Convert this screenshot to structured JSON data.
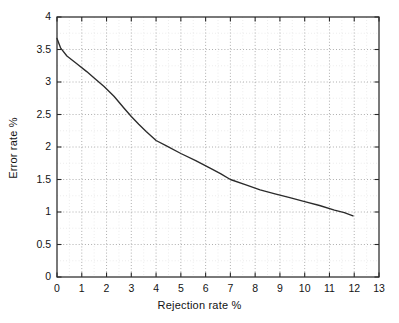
{
  "chart_data": {
    "type": "line",
    "title": "",
    "xlabel": "Rejection rate %",
    "ylabel": "Error rate %",
    "xlim": [
      0,
      13
    ],
    "ylim": [
      0,
      4
    ],
    "xticks": [
      "0",
      "1",
      "2",
      "3",
      "4",
      "5",
      "6",
      "7",
      "8",
      "9",
      "10",
      "11",
      "12",
      "13"
    ],
    "yticks": [
      "0",
      "0.5",
      "1",
      "1.5",
      "2",
      "2.5",
      "3",
      "3.5",
      "4"
    ],
    "grid": true,
    "grid_style": "dotted",
    "minor_grid": true,
    "legend": "none",
    "series": [
      {
        "name": "error vs rejection",
        "color": "#2b2b2b",
        "x": [
          0.0,
          0.15,
          0.4,
          0.8,
          1.2,
          1.5,
          1.9,
          2.3,
          2.7,
          3.0,
          3.3,
          3.6,
          4.0,
          4.4,
          5.0,
          5.6,
          6.2,
          6.6,
          7.0,
          7.6,
          8.2,
          8.8,
          9.4,
          10.0,
          10.6,
          11.2,
          11.6,
          11.95
        ],
        "y": [
          3.67,
          3.52,
          3.4,
          3.28,
          3.16,
          3.06,
          2.93,
          2.78,
          2.6,
          2.47,
          2.35,
          2.24,
          2.1,
          2.02,
          1.9,
          1.79,
          1.67,
          1.59,
          1.5,
          1.42,
          1.34,
          1.28,
          1.22,
          1.16,
          1.1,
          1.03,
          0.99,
          0.94
        ]
      }
    ]
  },
  "axes": {
    "y_tick_values": [
      0,
      0.5,
      1,
      1.5,
      2,
      2.5,
      3,
      3.5,
      4
    ],
    "x_tick_values": [
      0,
      1,
      2,
      3,
      4,
      5,
      6,
      7,
      8,
      9,
      10,
      11,
      12,
      13
    ]
  }
}
